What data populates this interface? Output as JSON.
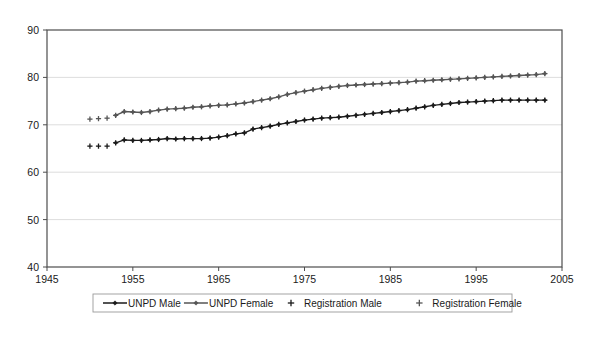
{
  "chart_data": {
    "type": "line",
    "title": "",
    "xlabel": "",
    "ylabel": "",
    "xlim": [
      1945,
      2005
    ],
    "ylim": [
      40,
      90
    ],
    "xticks": [
      1945,
      1955,
      1965,
      1975,
      1985,
      1995,
      2005
    ],
    "yticks": [
      40,
      50,
      60,
      70,
      80,
      90
    ],
    "grid": "horizontal",
    "legend_position": "bottom",
    "colors": {
      "unpd_male": "#1a1a1a",
      "unpd_female": "#555555",
      "registration_male": "#1a1a1a",
      "registration_female": "#555555",
      "gridline": "#d9d9d9",
      "axis": "#4d4d4d"
    },
    "series": [
      {
        "name": "UNPD Male",
        "marker": "diamond",
        "style": "line-marker",
        "x": [
          1953,
          1954,
          1955,
          1956,
          1957,
          1958,
          1959,
          1960,
          1961,
          1962,
          1963,
          1964,
          1965,
          1966,
          1967,
          1968,
          1969,
          1970,
          1971,
          1972,
          1973,
          1974,
          1975,
          1976,
          1977,
          1978,
          1979,
          1980,
          1981,
          1982,
          1983,
          1984,
          1985,
          1986,
          1987,
          1988,
          1989,
          1990,
          1991,
          1992,
          1993,
          1994,
          1995,
          1996,
          1997,
          1998,
          1999,
          2000,
          2001,
          2002,
          2003
        ],
        "values": [
          66.2,
          66.8,
          66.7,
          66.7,
          66.8,
          66.9,
          67.1,
          67.0,
          67.1,
          67.1,
          67.1,
          67.2,
          67.4,
          67.7,
          68.1,
          68.3,
          69.1,
          69.4,
          69.7,
          70.1,
          70.4,
          70.7,
          71.0,
          71.2,
          71.4,
          71.5,
          71.6,
          71.8,
          72.0,
          72.2,
          72.4,
          72.6,
          72.8,
          73.0,
          73.2,
          73.5,
          73.8,
          74.1,
          74.3,
          74.5,
          74.7,
          74.8,
          74.9,
          75.0,
          75.1,
          75.2,
          75.2,
          75.2,
          75.2,
          75.2,
          75.2
        ]
      },
      {
        "name": "UNPD Female",
        "marker": "diamond",
        "style": "line-marker",
        "x": [
          1953,
          1954,
          1955,
          1956,
          1957,
          1958,
          1959,
          1960,
          1961,
          1962,
          1963,
          1964,
          1965,
          1966,
          1967,
          1968,
          1969,
          1970,
          1971,
          1972,
          1973,
          1974,
          1975,
          1976,
          1977,
          1978,
          1979,
          1980,
          1981,
          1982,
          1983,
          1984,
          1985,
          1986,
          1987,
          1988,
          1989,
          1990,
          1991,
          1992,
          1993,
          1994,
          1995,
          1996,
          1997,
          1998,
          1999,
          2000,
          2001,
          2002,
          2003
        ],
        "values": [
          72.0,
          72.8,
          72.7,
          72.6,
          72.8,
          73.1,
          73.3,
          73.4,
          73.5,
          73.7,
          73.8,
          74.0,
          74.1,
          74.2,
          74.4,
          74.6,
          74.9,
          75.2,
          75.5,
          75.9,
          76.4,
          76.8,
          77.1,
          77.4,
          77.7,
          77.9,
          78.1,
          78.3,
          78.4,
          78.5,
          78.6,
          78.7,
          78.8,
          78.9,
          79.0,
          79.2,
          79.3,
          79.4,
          79.5,
          79.6,
          79.7,
          79.8,
          79.9,
          80.0,
          80.1,
          80.2,
          80.3,
          80.4,
          80.5,
          80.6,
          80.8
        ]
      },
      {
        "name": "Registration Male",
        "marker": "plus",
        "style": "marker-only",
        "x": [
          1950,
          1951,
          1952,
          1953,
          1954,
          1955,
          1956,
          1957,
          1958,
          1959,
          1960,
          1961,
          1962,
          1963,
          1964,
          1965,
          1966,
          1967,
          1968,
          1969,
          1970,
          1971,
          1972,
          1973,
          1974,
          1975,
          1976,
          1977,
          1978,
          1979,
          1980,
          1981,
          1982,
          1983,
          1984,
          1985,
          1986,
          1987,
          1988,
          1989,
          1990,
          1991,
          1992,
          1993,
          1994,
          1995,
          1996,
          1997,
          1998,
          1999,
          2000,
          2001,
          2002,
          2003
        ],
        "values": [
          65.5,
          65.5,
          65.5,
          66.2,
          66.8,
          66.7,
          66.7,
          66.8,
          66.9,
          67.1,
          67.0,
          67.1,
          67.1,
          67.1,
          67.2,
          67.4,
          67.7,
          68.1,
          68.3,
          69.1,
          69.4,
          69.7,
          70.1,
          70.4,
          70.7,
          71.0,
          71.2,
          71.4,
          71.5,
          71.6,
          71.8,
          72.0,
          72.2,
          72.4,
          72.6,
          72.8,
          73.0,
          73.2,
          73.5,
          73.8,
          74.1,
          74.3,
          74.5,
          74.7,
          74.8,
          74.9,
          75.0,
          75.1,
          75.2,
          75.2,
          75.2,
          75.2,
          75.2,
          75.2
        ]
      },
      {
        "name": "Registration Female",
        "marker": "plus",
        "style": "marker-only",
        "x": [
          1950,
          1951,
          1952,
          1953,
          1954,
          1955,
          1956,
          1957,
          1958,
          1959,
          1960,
          1961,
          1962,
          1963,
          1964,
          1965,
          1966,
          1967,
          1968,
          1969,
          1970,
          1971,
          1972,
          1973,
          1974,
          1975,
          1976,
          1977,
          1978,
          1979,
          1980,
          1981,
          1982,
          1983,
          1984,
          1985,
          1986,
          1987,
          1988,
          1989,
          1990,
          1991,
          1992,
          1993,
          1994,
          1995,
          1996,
          1997,
          1998,
          1999,
          2000,
          2001,
          2002,
          2003
        ],
        "values": [
          71.2,
          71.3,
          71.4,
          72.0,
          72.8,
          72.7,
          72.6,
          72.8,
          73.1,
          73.3,
          73.4,
          73.5,
          73.7,
          73.8,
          74.0,
          74.1,
          74.2,
          74.4,
          74.6,
          74.9,
          75.2,
          75.5,
          75.9,
          76.4,
          76.8,
          77.1,
          77.4,
          77.7,
          77.9,
          78.1,
          78.3,
          78.4,
          78.5,
          78.6,
          78.7,
          78.8,
          78.9,
          79.0,
          79.2,
          79.3,
          79.4,
          79.5,
          79.6,
          79.7,
          79.8,
          79.9,
          80.0,
          80.1,
          80.2,
          80.3,
          80.4,
          80.5,
          80.6,
          80.8
        ]
      }
    ],
    "legend": [
      {
        "label": "UNPD Male",
        "marker": "diamond",
        "style": "line-marker"
      },
      {
        "label": "UNPD Female",
        "marker": "diamond",
        "style": "line-marker"
      },
      {
        "label": "Registration Male",
        "marker": "plus",
        "style": "marker-only"
      },
      {
        "label": "Registration Female",
        "marker": "plus",
        "style": "marker-only"
      }
    ]
  }
}
